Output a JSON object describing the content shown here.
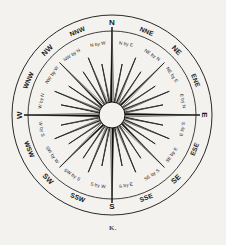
{
  "figure": {
    "caption": "K.",
    "background_color": "#f4f2ee",
    "ink_color": "#111111"
  },
  "geometry": {
    "center_x": 112,
    "center_y": 115,
    "outer_ring_radius": 100,
    "inner_ring_radius": 84,
    "hub_radius": 13,
    "major_spike_length": 88,
    "ordinal_spike_length": 74,
    "half_spike_length": 62,
    "by_point_spike_length": 52
  },
  "chart_data": {
    "type": "compass-rose",
    "point_count": 32,
    "degrees_per_point": 11.25,
    "points": [
      {
        "label": "N",
        "bearing": 0,
        "rank": "cardinal"
      },
      {
        "label": "N by E",
        "bearing": 11.25,
        "rank": "by-point"
      },
      {
        "label": "NNE",
        "bearing": 22.5,
        "rank": "half"
      },
      {
        "label": "NE by N",
        "bearing": 33.75,
        "rank": "by-point"
      },
      {
        "label": "NE",
        "bearing": 45,
        "rank": "ordinal"
      },
      {
        "label": "NE by E",
        "bearing": 56.25,
        "rank": "by-point"
      },
      {
        "label": "ENE",
        "bearing": 67.5,
        "rank": "half"
      },
      {
        "label": "E by N",
        "bearing": 78.75,
        "rank": "by-point"
      },
      {
        "label": "E",
        "bearing": 90,
        "rank": "cardinal"
      },
      {
        "label": "E by S",
        "bearing": 101.25,
        "rank": "by-point"
      },
      {
        "label": "ESE",
        "bearing": 112.5,
        "rank": "half"
      },
      {
        "label": "SE by E",
        "bearing": 123.75,
        "rank": "by-point"
      },
      {
        "label": "SE",
        "bearing": 135,
        "rank": "ordinal"
      },
      {
        "label": "SE by S",
        "bearing": 146.25,
        "rank": "by-point"
      },
      {
        "label": "SSE",
        "bearing": 157.5,
        "rank": "half"
      },
      {
        "label": "S by E",
        "bearing": 168.75,
        "rank": "by-point"
      },
      {
        "label": "S",
        "bearing": 180,
        "rank": "cardinal"
      },
      {
        "label": "S by W",
        "bearing": 191.25,
        "rank": "by-point"
      },
      {
        "label": "SSW",
        "bearing": 202.5,
        "rank": "half"
      },
      {
        "label": "SW by S",
        "bearing": 213.75,
        "rank": "by-point"
      },
      {
        "label": "SW",
        "bearing": 225,
        "rank": "ordinal"
      },
      {
        "label": "SW by W",
        "bearing": 236.25,
        "rank": "by-point"
      },
      {
        "label": "WSW",
        "bearing": 247.5,
        "rank": "half"
      },
      {
        "label": "W by S",
        "bearing": 258.75,
        "rank": "by-point"
      },
      {
        "label": "W",
        "bearing": 270,
        "rank": "cardinal"
      },
      {
        "label": "W by N",
        "bearing": 281.25,
        "rank": "by-point"
      },
      {
        "label": "WNW",
        "bearing": 292.5,
        "rank": "half"
      },
      {
        "label": "NW by W",
        "bearing": 303.75,
        "rank": "by-point"
      },
      {
        "label": "NW",
        "bearing": 315,
        "rank": "ordinal"
      },
      {
        "label": "NW by N",
        "bearing": 326.25,
        "rank": "by-point"
      },
      {
        "label": "NNW",
        "bearing": 337.5,
        "rank": "half"
      },
      {
        "label": "N by W",
        "bearing": 348.75,
        "rank": "by-point"
      }
    ]
  }
}
